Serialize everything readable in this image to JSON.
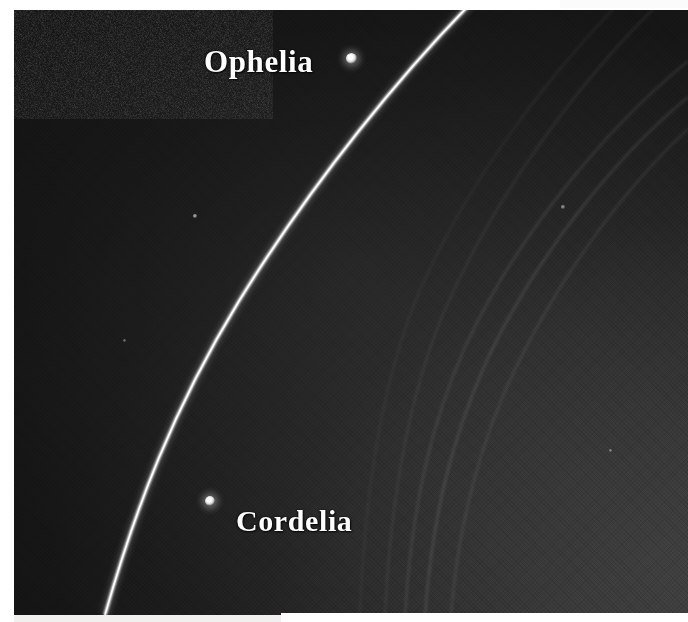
{
  "image": {
    "kind": "astronomical-photograph",
    "subject": "Uranus ring system",
    "caption_labels": [
      "Ophelia",
      "Cordelia"
    ],
    "background_color": "#262626",
    "dark_side_color": "#141414",
    "bright_side_color": "#474747",
    "border_color": "#ffffff"
  },
  "labels": {
    "ophelia": "Ophelia",
    "cordelia": "Cordelia"
  },
  "features": {
    "epsilon_ring": {
      "name": "epsilon-ring",
      "color": "#ffffff",
      "description": "bright narrow outermost ring arc"
    },
    "inner_rings": {
      "name": "faint-inner-rings",
      "color": "#8a8a8a",
      "count": 5
    },
    "moons": [
      {
        "name": "Ophelia",
        "x": 349,
        "y": 60,
        "diameter": 8,
        "color": "#ffffff"
      },
      {
        "name": "Cordelia",
        "x": 208,
        "y": 502,
        "diameter": 7,
        "color": "#ffffff"
      }
    ]
  }
}
